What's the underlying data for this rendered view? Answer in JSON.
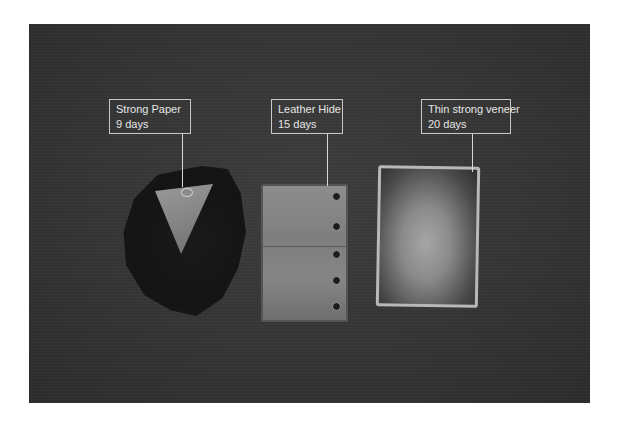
{
  "image": {
    "background_color": "#353535",
    "description": "Three aged material samples photographed on dark background with callout labels"
  },
  "callouts": [
    {
      "title": "Strong Paper",
      "duration": "9 days"
    },
    {
      "title": "Leather Hide",
      "duration": "15 days"
    },
    {
      "title": "Thin strong veneer",
      "duration": "20 days"
    }
  ]
}
